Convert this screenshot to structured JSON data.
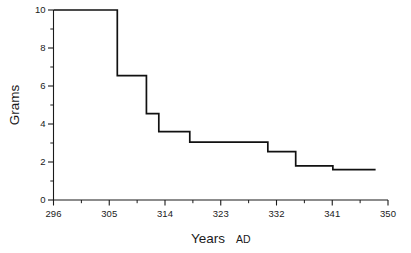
{
  "chart_data": {
    "type": "line",
    "subtype": "step",
    "title": "",
    "xlabel": "Years AD",
    "xlabel_main": "Years",
    "xlabel_sub": "AD",
    "ylabel": "Grams",
    "xlim": [
      296,
      350
    ],
    "ylim": [
      0,
      10
    ],
    "xticks": [
      296,
      305,
      314,
      323,
      332,
      341,
      350
    ],
    "xtick_labels": [
      "296",
      "305",
      "314",
      "323",
      "332",
      "341",
      "350"
    ],
    "yticks": [
      0,
      2,
      4,
      6,
      8,
      10
    ],
    "ytick_labels": [
      "0",
      "2",
      "4",
      "6",
      "8",
      "10"
    ],
    "y_minor_ticks": [
      1,
      3,
      5,
      7,
      9
    ],
    "x_minor_ticks": [
      300.5,
      309.5,
      318.5,
      327.5,
      336.5,
      345.5
    ],
    "grid": false,
    "legend": false,
    "line_color": "#111111",
    "axis_color": "#1a1a1a",
    "background_color": "#ffffff",
    "x": [
      296,
      306.3,
      311,
      313,
      318,
      330.6,
      335.1,
      341.1,
      348
    ],
    "values": [
      10,
      6.55,
      4.55,
      3.6,
      3.05,
      2.55,
      1.8,
      1.6,
      1.6
    ],
    "step_segments": [
      {
        "x_start": 296,
        "x_end": 306.3,
        "y": 10
      },
      {
        "x_start": 306.3,
        "x_end": 311,
        "y": 6.55
      },
      {
        "x_start": 311,
        "x_end": 313,
        "y": 4.55
      },
      {
        "x_start": 313,
        "x_end": 318,
        "y": 3.6
      },
      {
        "x_start": 318,
        "x_end": 330.6,
        "y": 3.05
      },
      {
        "x_start": 330.6,
        "x_end": 335.1,
        "y": 2.55
      },
      {
        "x_start": 335.1,
        "x_end": 341.1,
        "y": 1.8
      },
      {
        "x_start": 341.1,
        "x_end": 348,
        "y": 1.6
      }
    ]
  }
}
